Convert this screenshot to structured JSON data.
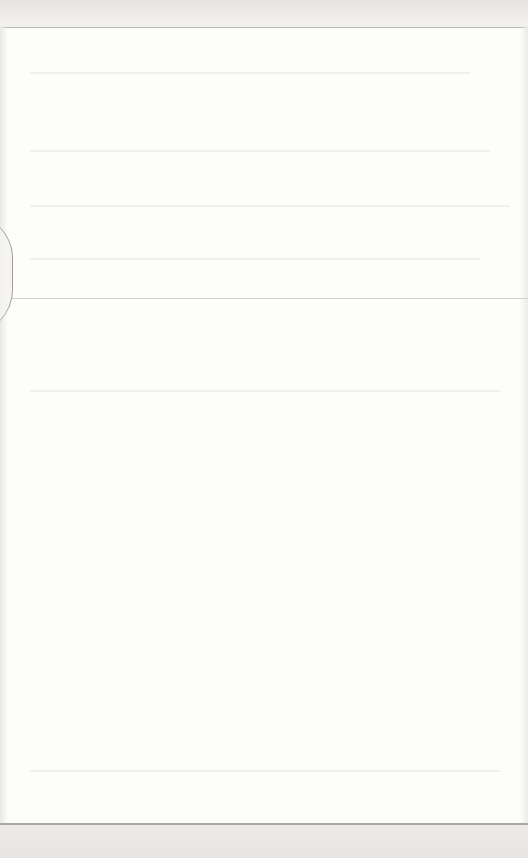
{
  "page": {
    "type": "scanned-page",
    "legible_text": "",
    "colors": {
      "paper": "#fdfdfc",
      "top_strip": "#e4e3e1",
      "rules": "#b9b8b6",
      "bottom_strip": "#e6e5e3"
    }
  }
}
